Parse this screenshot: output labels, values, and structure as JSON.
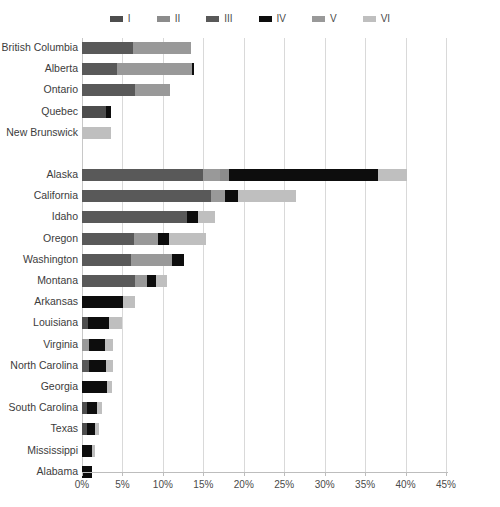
{
  "chart_data": {
    "type": "bar",
    "orientation": "horizontal",
    "stacked": true,
    "title": "",
    "xlabel": "",
    "ylabel": "",
    "xlim": [
      0,
      45
    ],
    "xunit": "%",
    "xticks": [
      0,
      5,
      10,
      15,
      20,
      25,
      30,
      35,
      40,
      45
    ],
    "xticklabels": [
      "0%",
      "5%",
      "10%",
      "15%",
      "20%",
      "25%",
      "30%",
      "35%",
      "40%",
      "45%"
    ],
    "grid": "vertical",
    "legend_position": "top-center",
    "legend": [
      {
        "name": "I",
        "color": "#4d4d4d"
      },
      {
        "name": "II",
        "color": "#8c8c8c"
      },
      {
        "name": "III",
        "color": "#595959"
      },
      {
        "name": "IV",
        "color": "#0d0d0d"
      },
      {
        "name": "V",
        "color": "#999999"
      },
      {
        "name": "VI",
        "color": "#bfbfbf"
      }
    ],
    "series": [
      {
        "name": "I",
        "color": "#4d4d4d"
      },
      {
        "name": "II",
        "color": "#8c8c8c"
      },
      {
        "name": "III",
        "color": "#595959"
      },
      {
        "name": "IV",
        "color": "#0d0d0d"
      },
      {
        "name": "V",
        "color": "#999999"
      },
      {
        "name": "VI",
        "color": "#bfbfbf"
      }
    ],
    "groups": [
      {
        "name": "Canada",
        "categories": [
          "British Columbia",
          "Alberta",
          "Ontario",
          "Quebec",
          "New Brunswick"
        ],
        "values": {
          "I": [
            0.0,
            0.0,
            0.0,
            1.9,
            0.0
          ],
          "II": [
            0.0,
            0.0,
            0.0,
            0.0,
            0.0
          ],
          "III": [
            6.3,
            4.3,
            6.5,
            0.0,
            0.0
          ],
          "IV": [
            0.0,
            0.0,
            0.0,
            0.6,
            0.0
          ],
          "V": [
            7.2,
            9.3,
            4.4,
            0.0,
            0.0
          ],
          "VI": [
            0.0,
            0.0,
            0.0,
            0.0,
            3.8
          ]
        }
      },
      {
        "name": "United States",
        "categories": [
          "Alaska",
          "California",
          "Idaho",
          "Oregon",
          "Washington",
          "Montana",
          "Arkansas",
          "Louisiana",
          "Virginia",
          "North Carolina",
          "Georgia",
          "South Carolina",
          "Texas",
          "Mississippi",
          "Alabama"
        ],
        "values": {
          "I": [
            0.0,
            0.0,
            0.0,
            0.0,
            0.0,
            0.0,
            0.0,
            0.0,
            0.9,
            0.8,
            0.0,
            0.6,
            0.6,
            0.5,
            0.0
          ],
          "II": [
            1.2,
            0.0,
            0.0,
            0.0,
            0.0,
            0.0,
            0.0,
            0.0,
            0.0,
            0.0,
            0.0,
            0.0,
            0.0,
            0.0,
            0.0
          ],
          "III": [
            15.0,
            16.0,
            13.0,
            6.4,
            13.6,
            6.5,
            5.1,
            0.0,
            0.0,
            0.9,
            0.0,
            0.0,
            0.0,
            0.0,
            0.0
          ],
          "IV": [
            18.4,
            1.6,
            1.8,
            1.5,
            1.9,
            1.8,
            0.0,
            3.3,
            1.8,
            1.5,
            3.4,
            1.2,
            1.0,
            0.9,
            1.1
          ],
          "V": [
            2.0,
            0.0,
            0.0,
            3.0,
            0.0,
            0.0,
            0.0,
            0.0,
            0.0,
            0.0,
            0.0,
            0.0,
            0.0,
            0.0,
            0.0
          ],
          "VI": [
            3.6,
            8.8,
            1.8,
            4.3,
            0.0,
            2.2,
            1.5,
            1.6,
            0.9,
            0.8,
            0.6,
            0.7,
            0.5,
            0.3,
            0.0
          ]
        }
      }
    ],
    "bars": [
      {
        "category": "British Columbia",
        "group": "Canada",
        "segments": [
          {
            "series": "III",
            "value": 6.3
          },
          {
            "series": "V",
            "value": 7.2
          }
        ],
        "total": 13.5
      },
      {
        "category": "Alberta",
        "group": "Canada",
        "segments": [
          {
            "series": "III",
            "value": 4.3
          },
          {
            "series": "V",
            "value": 9.3
          },
          {
            "series": "IV",
            "value": 0.2
          }
        ],
        "total": 13.8
      },
      {
        "category": "Ontario",
        "group": "Canada",
        "segments": [
          {
            "series": "III",
            "value": 6.5
          },
          {
            "series": "V",
            "value": 4.4
          }
        ],
        "total": 10.9
      },
      {
        "category": "Quebec",
        "group": "Canada",
        "segments": [
          {
            "series": "I",
            "value": 3.0
          },
          {
            "series": "IV",
            "value": 0.6
          }
        ],
        "total": 3.6
      },
      {
        "category": "New Brunswick",
        "group": "Canada",
        "segments": [
          {
            "series": "VI",
            "value": 3.6
          }
        ],
        "total": 3.6
      },
      {
        "category": "Alaska",
        "group": "United States",
        "segments": [
          {
            "series": "III",
            "value": 15.0
          },
          {
            "series": "V",
            "value": 2.0
          },
          {
            "series": "II",
            "value": 1.2
          },
          {
            "series": "IV",
            "value": 18.4
          },
          {
            "series": "VI",
            "value": 3.6
          }
        ],
        "total": 40.2
      },
      {
        "category": "California",
        "group": "United States",
        "segments": [
          {
            "series": "III",
            "value": 16.0
          },
          {
            "series": "V",
            "value": 1.7
          },
          {
            "series": "IV",
            "value": 1.6
          },
          {
            "series": "VI",
            "value": 7.1
          }
        ],
        "total": 26.4
      },
      {
        "category": "Idaho",
        "group": "United States",
        "segments": [
          {
            "series": "III",
            "value": 13.0
          },
          {
            "series": "IV",
            "value": 1.4
          },
          {
            "series": "VI",
            "value": 2.0
          }
        ],
        "total": 16.4
      },
      {
        "category": "Oregon",
        "group": "United States",
        "segments": [
          {
            "series": "III",
            "value": 6.4
          },
          {
            "series": "V",
            "value": 3.0
          },
          {
            "series": "IV",
            "value": 1.4
          },
          {
            "series": "VI",
            "value": 4.5
          }
        ],
        "total": 15.3
      },
      {
        "category": "Washington",
        "group": "United States",
        "segments": [
          {
            "series": "III",
            "value": 6.0
          },
          {
            "series": "V",
            "value": 5.1
          },
          {
            "series": "IV",
            "value": 1.5
          }
        ],
        "total": 12.6
      },
      {
        "category": "Montana",
        "group": "United States",
        "segments": [
          {
            "series": "III",
            "value": 6.5
          },
          {
            "series": "V",
            "value": 1.5
          },
          {
            "series": "IV",
            "value": 1.2
          },
          {
            "series": "VI",
            "value": 1.3
          }
        ],
        "total": 10.5
      },
      {
        "category": "Arkansas",
        "group": "United States",
        "segments": [
          {
            "series": "IV",
            "value": 5.1
          },
          {
            "series": "VI",
            "value": 1.5
          }
        ],
        "total": 6.6
      },
      {
        "category": "Louisiana",
        "group": "United States",
        "segments": [
          {
            "series": "I",
            "value": 0.8
          },
          {
            "series": "IV",
            "value": 2.6
          },
          {
            "series": "VI",
            "value": 1.6
          }
        ],
        "total": 5.0
      },
      {
        "category": "Virginia",
        "group": "United States",
        "segments": [
          {
            "series": "V",
            "value": 0.9
          },
          {
            "series": "IV",
            "value": 2.0
          },
          {
            "series": "VI",
            "value": 0.9
          }
        ],
        "total": 3.8
      },
      {
        "category": "North Carolina",
        "group": "United States",
        "segments": [
          {
            "series": "III",
            "value": 0.9
          },
          {
            "series": "IV",
            "value": 2.1
          },
          {
            "series": "VI",
            "value": 0.8
          }
        ],
        "total": 3.8
      },
      {
        "category": "Georgia",
        "group": "United States",
        "segments": [
          {
            "series": "IV",
            "value": 3.1
          },
          {
            "series": "VI",
            "value": 0.6
          }
        ],
        "total": 3.7
      },
      {
        "category": "South Carolina",
        "group": "United States",
        "segments": [
          {
            "series": "I",
            "value": 0.6
          },
          {
            "series": "IV",
            "value": 1.2
          },
          {
            "series": "VI",
            "value": 0.7
          }
        ],
        "total": 2.5
      },
      {
        "category": "Texas",
        "group": "United States",
        "segments": [
          {
            "series": "I",
            "value": 0.6
          },
          {
            "series": "IV",
            "value": 1.0
          },
          {
            "series": "VI",
            "value": 0.5
          }
        ],
        "total": 2.1
      },
      {
        "category": "Mississippi",
        "group": "United States",
        "segments": [
          {
            "series": "IV",
            "value": 1.2
          },
          {
            "series": "VI",
            "value": 0.4
          }
        ],
        "total": 1.6
      },
      {
        "category": "Alabama",
        "group": "United States",
        "segments": [
          {
            "series": "IV",
            "value": 1.2
          }
        ],
        "total": 1.2
      }
    ]
  }
}
